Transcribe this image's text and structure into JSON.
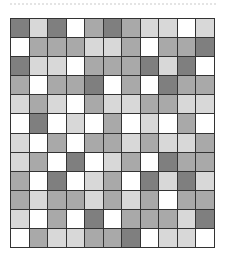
{
  "legend": {
    "D": "dark",
    "M": "medium",
    "L": "light",
    "W": "white"
  },
  "colors": {
    "D": "#7f7f7f",
    "M": "#a9a9a9",
    "L": "#d8d8d8",
    "W": "#ffffff",
    "border": "#333333"
  },
  "grid": {
    "columns": 11,
    "rows": [
      [
        "D",
        "L",
        "D",
        "W",
        "M",
        "D",
        "M",
        "L",
        "L",
        "W",
        "L"
      ],
      [
        "W",
        "M",
        "M",
        "M",
        "L",
        "L",
        "M",
        "W",
        "M",
        "M",
        "D"
      ],
      [
        "D",
        "L",
        "L",
        "W",
        "M",
        "M",
        "M",
        "D",
        "L",
        "D",
        "W"
      ],
      [
        "M",
        "W",
        "M",
        "M",
        "D",
        "W",
        "M",
        "W",
        "D",
        "M",
        "M"
      ],
      [
        "L",
        "M",
        "L",
        "W",
        "M",
        "L",
        "L",
        "M",
        "M",
        "L",
        "L"
      ],
      [
        "W",
        "D",
        "W",
        "L",
        "W",
        "M",
        "W",
        "L",
        "W",
        "M",
        "W"
      ],
      [
        "L",
        "W",
        "M",
        "W",
        "M",
        "M",
        "L",
        "M",
        "L",
        "L",
        "M"
      ],
      [
        "L",
        "M",
        "W",
        "D",
        "W",
        "L",
        "M",
        "W",
        "D",
        "M",
        "M"
      ],
      [
        "M",
        "W",
        "D",
        "W",
        "L",
        "M",
        "W",
        "D",
        "L",
        "D",
        "L"
      ],
      [
        "M",
        "L",
        "M",
        "M",
        "L",
        "M",
        "L",
        "M",
        "W",
        "M",
        "M"
      ],
      [
        "L",
        "W",
        "M",
        "W",
        "D",
        "W",
        "M",
        "M",
        "M",
        "L",
        "D"
      ],
      [
        "W",
        "M",
        "L",
        "L",
        "M",
        "M",
        "D",
        "W",
        "L",
        "L",
        "W"
      ]
    ]
  }
}
